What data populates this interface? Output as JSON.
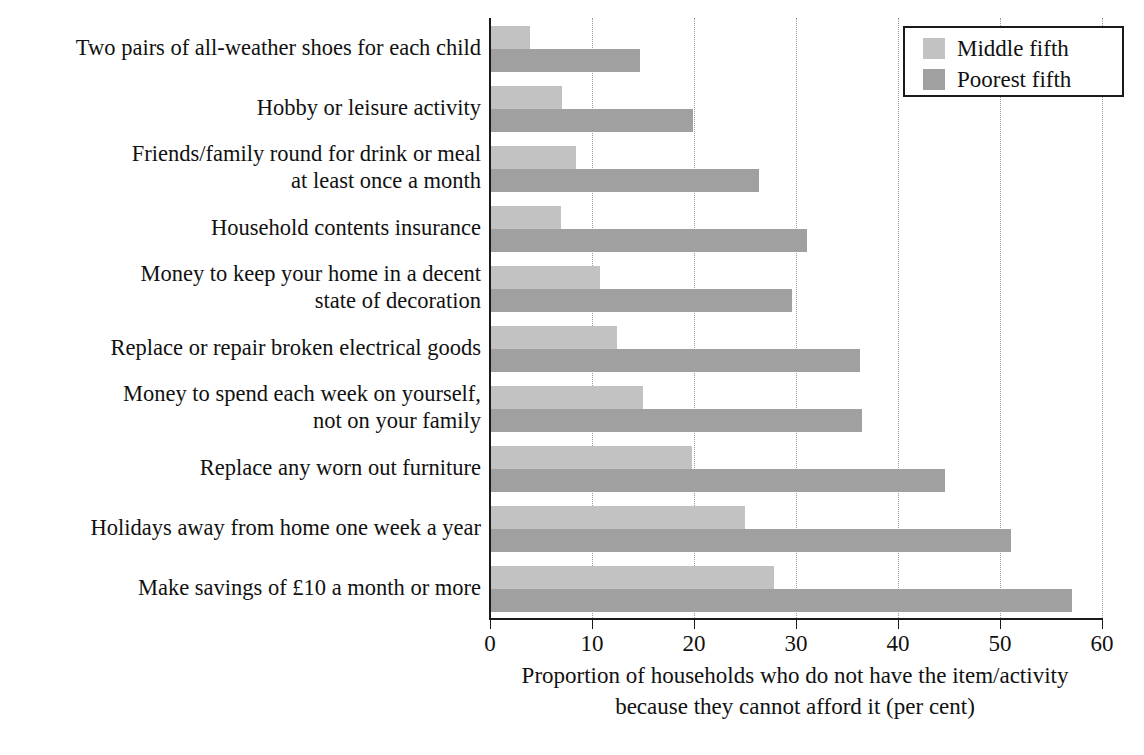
{
  "chart_data": {
    "type": "bar",
    "orientation": "horizontal",
    "title": "",
    "xlabel": "Proportion of households who do not have the item/activity\nbecause they cannot afford it (per cent)",
    "ylabel": "",
    "xlim": [
      0,
      60
    ],
    "xticks": [
      0,
      10,
      20,
      30,
      40,
      50,
      60
    ],
    "xtick_labels": [
      "0",
      "10",
      "20",
      "30",
      "40",
      "50",
      "60"
    ],
    "grid": true,
    "grid_style": "dotted-vertical",
    "legend_position": "top-right",
    "categories": [
      "Two pairs of all-weather shoes for each child",
      "Hobby or leisure activity",
      "Friends/family round for drink or meal\nat least once a month",
      "Household contents insurance",
      "Money to keep your home in a decent\nstate of decoration",
      "Replace or repair broken electrical goods",
      "Money to spend each week on yourself,\nnot on your family",
      "Replace any worn out furniture",
      "Holidays away from home one week a year",
      "Make savings of £10 a month or more"
    ],
    "series": [
      {
        "name": "Middle fifth",
        "color": "#c2c2c2",
        "values": [
          3.8,
          7.0,
          8.3,
          6.9,
          10.7,
          12.4,
          14.9,
          19.7,
          24.9,
          27.7
        ]
      },
      {
        "name": "Poorest fifth",
        "color": "#a0a0a0",
        "values": [
          14.6,
          19.8,
          26.3,
          31.0,
          29.5,
          36.2,
          36.4,
          44.5,
          51.0,
          57.0
        ]
      }
    ]
  },
  "legend": {
    "entries": [
      {
        "label": "Middle fifth",
        "swatch": "middle"
      },
      {
        "label": "Poorest fifth",
        "swatch": "poorest"
      }
    ]
  }
}
